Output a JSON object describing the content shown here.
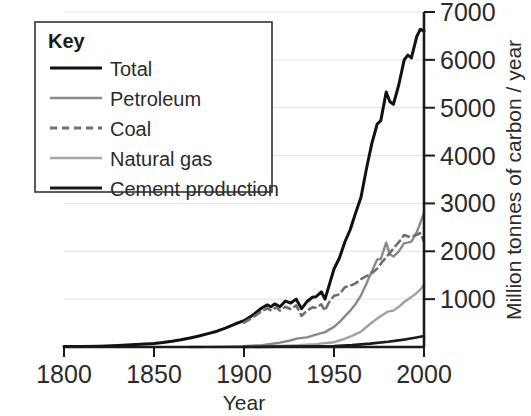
{
  "chart_data": {
    "type": "line",
    "title": "",
    "xlabel": "Year",
    "ylabel": "Million tonnes of carbon / year",
    "xlim": [
      1800,
      2000
    ],
    "ylim": [
      0,
      7000
    ],
    "grid": true,
    "x_ticks": [
      "1800",
      "1850",
      "1900",
      "1950",
      "2000"
    ],
    "x_tick_values": [
      1800,
      1850,
      1900,
      1950,
      2000
    ],
    "y_ticks": [
      "1000",
      "2000",
      "3000",
      "4000",
      "5000",
      "6000",
      "7000"
    ],
    "y_tick_values": [
      1000,
      2000,
      3000,
      4000,
      5000,
      6000,
      7000
    ],
    "legend_position": "top-left",
    "legend_title": "Key",
    "series": [
      {
        "name": "Total",
        "style": "solid",
        "width": 3.0,
        "color": "#111111",
        "x": [
          1800,
          1810,
          1820,
          1830,
          1840,
          1850,
          1855,
          1860,
          1865,
          1870,
          1875,
          1880,
          1885,
          1890,
          1895,
          1900,
          1905,
          1910,
          1913,
          1915,
          1917,
          1920,
          1923,
          1926,
          1929,
          1932,
          1935,
          1938,
          1940,
          1943,
          1945,
          1947,
          1950,
          1953,
          1956,
          1959,
          1962,
          1965,
          1968,
          1971,
          1974,
          1976,
          1979,
          1981,
          1983,
          1986,
          1989,
          1991,
          1993,
          1996,
          1998,
          2000
        ],
        "y": [
          8,
          12,
          18,
          30,
          50,
          75,
          95,
          120,
          150,
          190,
          230,
          280,
          330,
          400,
          480,
          550,
          670,
          820,
          880,
          840,
          900,
          840,
          960,
          920,
          1000,
          800,
          950,
          1040,
          1050,
          1150,
          1000,
          1250,
          1630,
          1860,
          2190,
          2450,
          2800,
          3130,
          3720,
          4250,
          4660,
          4730,
          5330,
          5130,
          5070,
          5480,
          6000,
          6100,
          6040,
          6490,
          6640,
          6600
        ]
      },
      {
        "name": "Petroleum",
        "style": "solid",
        "width": 2.4,
        "color": "#888888",
        "x": [
          1870,
          1880,
          1890,
          1900,
          1910,
          1920,
          1925,
          1930,
          1935,
          1940,
          1945,
          1950,
          1953,
          1956,
          1959,
          1962,
          1965,
          1968,
          1971,
          1974,
          1976,
          1979,
          1981,
          1983,
          1986,
          1989,
          1991,
          1993,
          1996,
          1998,
          2000
        ],
        "y": [
          1,
          3,
          8,
          18,
          40,
          90,
          130,
          180,
          200,
          260,
          310,
          420,
          520,
          640,
          760,
          900,
          1080,
          1320,
          1580,
          1830,
          1840,
          2180,
          1940,
          1890,
          2000,
          2170,
          2180,
          2200,
          2400,
          2600,
          2800
        ]
      },
      {
        "name": "Coal",
        "style": "dashed",
        "width": 2.6,
        "color": "#6e6e6e",
        "x": [
          1900,
          1905,
          1910,
          1913,
          1915,
          1918,
          1920,
          1923,
          1926,
          1929,
          1932,
          1935,
          1938,
          1940,
          1943,
          1945,
          1947,
          1950,
          1953,
          1956,
          1959,
          1962,
          1965,
          1968,
          1971,
          1974,
          1977,
          1980,
          1983,
          1986,
          1989,
          1992,
          1995,
          1998,
          2000
        ],
        "y": [
          510,
          620,
          750,
          810,
          760,
          830,
          760,
          840,
          790,
          870,
          650,
          760,
          830,
          820,
          890,
          760,
          920,
          1070,
          1100,
          1250,
          1280,
          1330,
          1420,
          1480,
          1540,
          1640,
          1790,
          1920,
          2060,
          2190,
          2340,
          2300,
          2330,
          2380,
          2200
        ]
      },
      {
        "name": "Natural gas",
        "style": "solid",
        "width": 2.4,
        "color": "#a0a0a0",
        "x": [
          1900,
          1910,
          1920,
          1930,
          1940,
          1945,
          1950,
          1955,
          1960,
          1965,
          1970,
          1975,
          1980,
          1983,
          1986,
          1989,
          1992,
          1995,
          1998,
          2000
        ],
        "y": [
          4,
          10,
          20,
          35,
          60,
          80,
          100,
          160,
          230,
          320,
          480,
          620,
          740,
          760,
          840,
          940,
          1020,
          1100,
          1200,
          1300
        ]
      },
      {
        "name": "Cement production",
        "style": "solid",
        "width": 2.6,
        "color": "#1a1a1a",
        "x": [
          1900,
          1920,
          1940,
          1950,
          1960,
          1970,
          1980,
          1990,
          1995,
          2000
        ],
        "y": [
          2,
          7,
          15,
          22,
          40,
          70,
          110,
          160,
          195,
          230
        ]
      }
    ]
  },
  "legend": {
    "title": "Key",
    "entries": [
      {
        "label": "Total",
        "color": "#111111",
        "style": "solid",
        "width": 3.2
      },
      {
        "label": "Petroleum",
        "color": "#8a8a8a",
        "style": "solid",
        "width": 2.4
      },
      {
        "label": "Coal",
        "color": "#6e6e6e",
        "style": "dashed",
        "width": 2.8
      },
      {
        "label": "Natural gas",
        "color": "#a6a6a6",
        "style": "solid",
        "width": 2.4
      },
      {
        "label": "Cement production",
        "color": "#1a1a1a",
        "style": "solid",
        "width": 3.0
      }
    ]
  },
  "axes": {
    "x_title": "Year",
    "y_title": "Million tonnes of carbon / year"
  },
  "colors": {
    "background": "#ffffff",
    "axis": "#1a1a1a",
    "grid": "#e2e2e2",
    "text": "#2b2b2b"
  }
}
